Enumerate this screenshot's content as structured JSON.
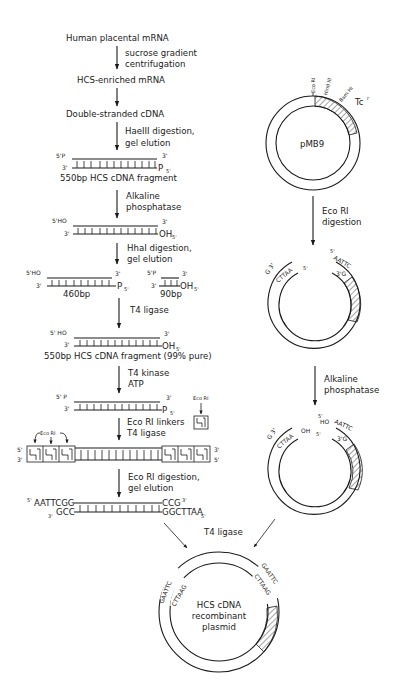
{
  "left_flow": {
    "steps": [
      {
        "label": "Human placental mRNA"
      },
      {
        "label": "HCS-enriched mRNA"
      },
      {
        "label": "Double-stranded cDNA"
      }
    ],
    "arrows": [
      {
        "line1": "sucrose gradient",
        "line2": "centrifugation"
      },
      {
        "line1": "",
        "line2": ""
      },
      {
        "line1": "HaeIII digestion,",
        "line2": "gel elution"
      },
      {
        "line1": "Alkaline",
        "line2": "phosphatase"
      },
      {
        "line1": "HhaI digestion,",
        "line2": "gel elution"
      },
      {
        "line1": "T4 ligase",
        "line2": ""
      },
      {
        "line1": "T4 kinase",
        "line2": "ATP"
      },
      {
        "line1": "Eco RI linkers",
        "line2": "T4 ligase"
      },
      {
        "line1": "Eco RI digestion,",
        "line2": "gel elution"
      }
    ],
    "fragments": {
      "f550": {
        "top_left": "5'P",
        "top_right": "3'",
        "bot_left": "3'",
        "bot_right": "P",
        "bot_right_sup": "5'",
        "caption": "550bp HCS cDNA fragment"
      },
      "f550_dephos": {
        "top_left": "5'HO",
        "top_right": "3'",
        "bot_left": "3'",
        "bot_right": "OH",
        "bot_right_sup": "5'"
      },
      "f460": {
        "top_left": "5'HO",
        "top_right": "3'",
        "bot_left": "3'",
        "bot_right": "P",
        "bot_right_sup": "5'",
        "caption": "460bp"
      },
      "f90": {
        "top_left": "5'P",
        "top_right": "3'",
        "bot_left": "3'",
        "bot_right": "OH",
        "bot_right_sup": "5'",
        "caption": "90bp"
      },
      "f550_pure": {
        "top_left": "5' HO",
        "top_right": "3'",
        "bot_left": "3'",
        "bot_right": "OH",
        "bot_right_sup": "5'",
        "caption": "550bp HCS cDNA fragment (99% pure)"
      },
      "f550_kinased": {
        "top_left": "5' P",
        "top_right": "3'",
        "bot_left": "3'",
        "bot_right": "P",
        "bot_right_sup": "5'"
      },
      "linker_label": "Eco RI",
      "linked": {
        "label": "Eco RI",
        "top_left": "5'",
        "bot_left": "3'",
        "top_right": "3'",
        "bot_right": "5'"
      },
      "sticky": {
        "top_left_sup": "5'",
        "top_left": "AATTCGG",
        "top_right": "CCG",
        "top_right_sup": "3'",
        "bot_left_sup": "3'",
        "bot_left": "GCC",
        "bot_right": "GGCTTAA",
        "bot_right_sup": "5'"
      }
    }
  },
  "right_flow": {
    "plasmid": {
      "name": "pMB9",
      "sites": [
        "Eco RI",
        "Hind III",
        "Bam HI"
      ],
      "marker": "Tc",
      "marker_sup": "r"
    },
    "arrows": [
      {
        "line1": "Eco RI",
        "line2": "digestion"
      },
      {
        "line1": "Alkaline",
        "line2": "phosphatase"
      }
    ],
    "cut": {
      "left_top": "G 3'",
      "left_bot": "CTTAA",
      "left_bot_sup": "5'",
      "right_top_sup": "5'",
      "right_top": "AATTC",
      "right_bot": "3'G"
    },
    "dephos": {
      "left_top": "G 3'",
      "left_bot": "CTTAA",
      "left_oh": "OH",
      "left_sup": "5'",
      "right_sup": "5'",
      "right_ho": "HO",
      "right_top": "AATTC",
      "right_bot": "3'G"
    }
  },
  "final": {
    "ligase_label": "T4 ligase",
    "title_line1": "HCS cDNA",
    "title_line2": "recombinant",
    "title_line3": "plasmid",
    "left_outer": "GAATTC",
    "left_inner": "CTTAAG",
    "right_outer": "GAATTC",
    "right_inner": "CTTAAG"
  }
}
